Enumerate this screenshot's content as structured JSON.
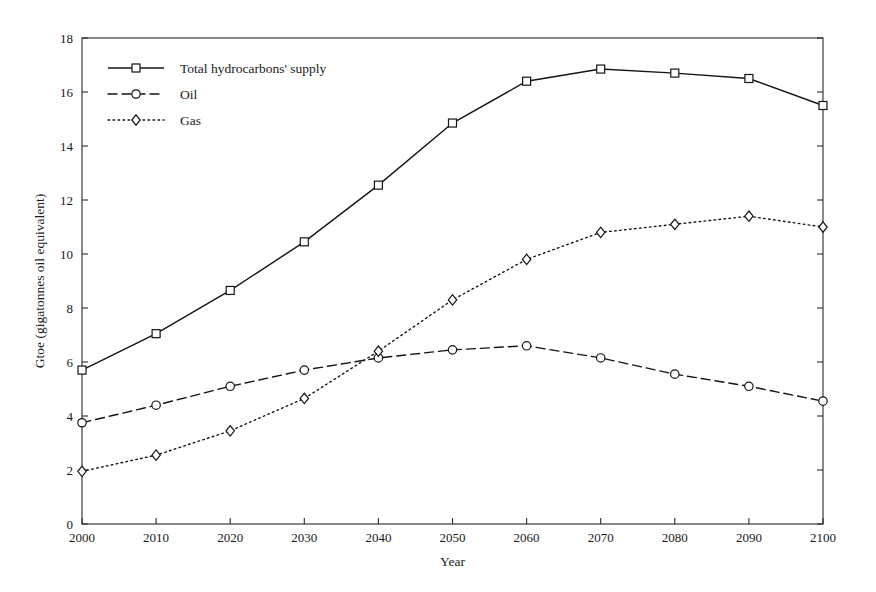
{
  "chart_data": {
    "type": "line",
    "title": "",
    "xlabel": "Year",
    "ylabel": "Gtoe (gigatonnes oil equivalent)",
    "x": [
      2000,
      2010,
      2020,
      2030,
      2040,
      2050,
      2060,
      2070,
      2080,
      2090,
      2100
    ],
    "xtick_labels": [
      "2000",
      "2010",
      "2020",
      "2030",
      "2040",
      "2050",
      "2060",
      "2070",
      "2080",
      "2090",
      "2100"
    ],
    "ytick_labels": [
      "0",
      "2",
      "4",
      "6",
      "8",
      "10",
      "12",
      "14",
      "16",
      "18"
    ],
    "yticks": [
      0,
      2,
      4,
      6,
      8,
      10,
      12,
      14,
      16,
      18
    ],
    "xlim": [
      2000,
      2100
    ],
    "ylim": [
      0,
      18
    ],
    "grid": false,
    "legend_position": "top-left",
    "series": [
      {
        "name": "Total hydrocarbons' supply",
        "marker": "square",
        "dash": "none",
        "color": "#141414",
        "values": [
          5.7,
          7.05,
          8.65,
          10.45,
          12.55,
          14.85,
          16.4,
          16.85,
          16.7,
          16.5,
          15.5
        ]
      },
      {
        "name": "Oil",
        "marker": "circle",
        "dash": "dashed",
        "color": "#141414",
        "values": [
          3.75,
          4.4,
          5.1,
          5.7,
          6.15,
          6.45,
          6.6,
          6.15,
          5.55,
          5.1,
          4.55
        ]
      },
      {
        "name": "Gas",
        "marker": "diamond",
        "dash": "dotted",
        "color": "#141414",
        "values": [
          1.95,
          2.55,
          3.45,
          4.65,
          6.4,
          8.3,
          9.8,
          10.8,
          11.1,
          11.4,
          11.0
        ]
      }
    ]
  }
}
